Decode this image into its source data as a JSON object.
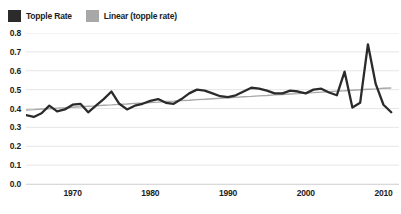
{
  "legend": {
    "position": "top-left",
    "entries": [
      {
        "label": "Topple Rate",
        "color": "#2b2b2b",
        "icon": "series-swatch"
      },
      {
        "label": "Linear (topple rate)",
        "color": "#a8a8a8",
        "icon": "trendline-swatch"
      }
    ]
  },
  "chart_data": {
    "type": "line",
    "title": "",
    "xlabel": "",
    "ylabel": "",
    "xlim": [
      1964,
      2012
    ],
    "ylim": [
      0.0,
      0.8
    ],
    "grid": true,
    "legend_position": "top-left",
    "y_ticks": [
      "0.0",
      "0.1",
      "0.2",
      "0.3",
      "0.4",
      "0.5",
      "0.6",
      "0.7",
      "0.8"
    ],
    "y_tick_values": [
      0.0,
      0.1,
      0.2,
      0.3,
      0.4,
      0.5,
      0.6,
      0.7,
      0.8
    ],
    "x_ticks": [
      "1970",
      "1980",
      "1990",
      "2000",
      "2010"
    ],
    "x_tick_values": [
      1970,
      1980,
      1990,
      2000,
      2010
    ],
    "x": [
      1964,
      1965,
      1966,
      1967,
      1968,
      1969,
      1970,
      1971,
      1972,
      1973,
      1974,
      1975,
      1976,
      1977,
      1978,
      1979,
      1980,
      1981,
      1982,
      1983,
      1984,
      1985,
      1986,
      1987,
      1988,
      1989,
      1990,
      1991,
      1992,
      1993,
      1994,
      1995,
      1996,
      1997,
      1998,
      1999,
      2000,
      2001,
      2002,
      2003,
      2004,
      2005,
      2006,
      2007,
      2008,
      2009,
      2010,
      2011
    ],
    "series": [
      {
        "name": "Topple Rate",
        "color": "#2b2b2b",
        "type": "line",
        "values": [
          0.365,
          0.355,
          0.375,
          0.415,
          0.385,
          0.395,
          0.42,
          0.425,
          0.38,
          0.415,
          0.45,
          0.49,
          0.425,
          0.395,
          0.415,
          0.425,
          0.44,
          0.45,
          0.43,
          0.425,
          0.45,
          0.48,
          0.5,
          0.495,
          0.48,
          0.465,
          0.46,
          0.47,
          0.49,
          0.51,
          0.505,
          0.495,
          0.48,
          0.48,
          0.495,
          0.49,
          0.48,
          0.5,
          0.505,
          0.485,
          0.47,
          0.595,
          0.405,
          0.43,
          0.74,
          0.53,
          0.42,
          0.38
        ]
      },
      {
        "name": "Linear (topple rate)",
        "color": "#a8a8a8",
        "type": "trendline",
        "values": [
          0.392,
          0.394,
          0.397,
          0.399,
          0.402,
          0.404,
          0.407,
          0.409,
          0.412,
          0.414,
          0.417,
          0.419,
          0.422,
          0.424,
          0.427,
          0.429,
          0.432,
          0.434,
          0.437,
          0.439,
          0.442,
          0.444,
          0.447,
          0.449,
          0.452,
          0.454,
          0.457,
          0.459,
          0.462,
          0.464,
          0.467,
          0.469,
          0.472,
          0.474,
          0.477,
          0.479,
          0.482,
          0.484,
          0.487,
          0.489,
          0.492,
          0.494,
          0.497,
          0.499,
          0.502,
          0.504,
          0.507,
          0.509
        ]
      }
    ]
  }
}
